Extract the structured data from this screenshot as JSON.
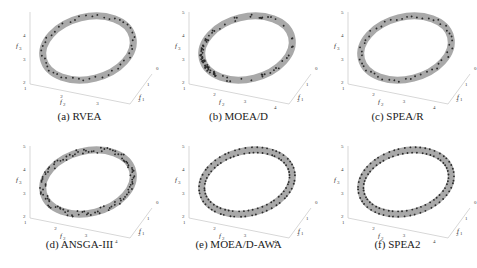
{
  "figure": {
    "ring_color": "#a9a9a9",
    "point_color": "#2b2b2b",
    "axis_color": "#bdbdbd"
  },
  "chart_data": [
    {
      "type": "scatter",
      "subtype": "3d-scatter-with-surface",
      "title": "(a) RVEA",
      "xlabel": "f1",
      "ylabel": "f2",
      "zlabel": "f3",
      "x_ticks": [
        "0",
        "1",
        "2"
      ],
      "y_ticks": [
        "1",
        "2",
        "3"
      ],
      "z_ticks": [
        "2",
        "3",
        "4"
      ],
      "zlim": [
        2,
        5
      ],
      "points_approx": 48,
      "distribution": "uniform along ring, sparse"
    },
    {
      "type": "scatter",
      "subtype": "3d-scatter-with-surface",
      "title": "(b) MOEA/D",
      "xlabel": "f1",
      "ylabel": "f2",
      "zlabel": "f3",
      "x_ticks": [
        "0",
        "1",
        "2"
      ],
      "y_ticks": [
        "1",
        "2",
        "3",
        "4"
      ],
      "z_ticks": [
        "2",
        "3",
        "4",
        "5"
      ],
      "zlim": [
        2,
        5
      ],
      "points_approx": 90,
      "distribution": "clustered on lower-left of ring"
    },
    {
      "type": "scatter",
      "subtype": "3d-scatter-with-surface",
      "title": "(c) SPEA/R",
      "xlabel": "f1",
      "ylabel": "f2",
      "zlabel": "f3",
      "x_ticks": [
        "0",
        "1",
        "2"
      ],
      "y_ticks": [
        "1",
        "2",
        "3",
        "4"
      ],
      "z_ticks": [
        "2",
        "3",
        "4",
        "5"
      ],
      "zlim": [
        2,
        5
      ],
      "points_approx": 50,
      "distribution": "uniform along ring"
    },
    {
      "type": "scatter",
      "subtype": "3d-scatter-with-surface",
      "title": "(d) ANSGA-III",
      "xlabel": "f1",
      "ylabel": "f2",
      "zlabel": "f3",
      "x_ticks": [
        "0",
        "1",
        "2"
      ],
      "y_ticks": [
        "1",
        "2",
        "3",
        "4"
      ],
      "z_ticks": [
        "2",
        "3",
        "4",
        "5"
      ],
      "zlim": [
        2,
        5
      ],
      "points_approx": 110,
      "distribution": "dense, spread across ring width"
    },
    {
      "type": "scatter",
      "subtype": "3d-scatter-with-surface",
      "title": "(e) MOEA/D-AWA",
      "xlabel": "f1",
      "ylabel": "f2",
      "zlabel": "f3",
      "x_ticks": [
        "0",
        "1",
        "2"
      ],
      "y_ticks": [
        "1",
        "2",
        "3",
        "4"
      ],
      "z_ticks": [
        "2",
        "3",
        "4",
        "5"
      ],
      "zlim": [
        2,
        5
      ],
      "points_approx": 110,
      "distribution": "dense, on both ring edges"
    },
    {
      "type": "scatter",
      "subtype": "3d-scatter-with-surface",
      "title": "(f) SPEA2",
      "xlabel": "f1",
      "ylabel": "f2",
      "zlabel": "f3",
      "x_ticks": [
        "0",
        "1",
        "2"
      ],
      "y_ticks": [
        "1",
        "2",
        "3",
        "4"
      ],
      "z_ticks": [
        "2",
        "3",
        "4",
        "5"
      ],
      "zlim": [
        2,
        5
      ],
      "points_approx": 110,
      "distribution": "dense, on both ring edges"
    }
  ],
  "panels": [
    {
      "caption": "(a) RVEA"
    },
    {
      "caption": "(b) MOEA/D"
    },
    {
      "caption": "(c) SPEA/R"
    },
    {
      "caption": "(d) ANSGA-III"
    },
    {
      "caption": "(e) MOEA/D-AWA"
    },
    {
      "caption": "(f) SPEA2"
    }
  ]
}
